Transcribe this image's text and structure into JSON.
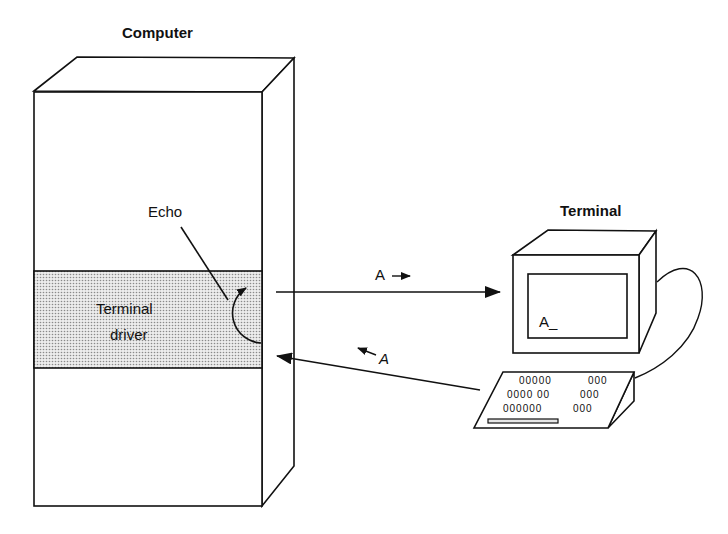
{
  "diagram": {
    "computer": {
      "title": "Computer",
      "driver_label_line1": "Terminal",
      "driver_label_line2": "driver",
      "echo_label": "Echo"
    },
    "terminal": {
      "title": "Terminal",
      "screen_text": "A_",
      "keyboard_rows": [
        {
          "left": "00000",
          "right": "000"
        },
        {
          "left": "0000 00",
          "right": "000"
        },
        {
          "left": "000000",
          "right": "000"
        }
      ]
    },
    "arrows": {
      "to_terminal_label": "A",
      "to_computer_label": "A"
    },
    "colors": {
      "line": "#111111",
      "driver_fill": "#d9d9d9",
      "background": "#ffffff"
    }
  }
}
